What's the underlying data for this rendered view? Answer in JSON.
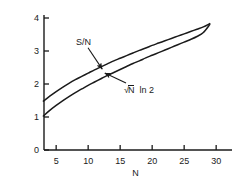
{
  "chart_data": {
    "type": "line",
    "title": "",
    "xlabel": "N",
    "ylabel": "",
    "xlim": [
      3.1,
      31.3
    ],
    "ylim": [
      0,
      4.15
    ],
    "grid": false,
    "legend_position": "inline-annotations",
    "xticks": [
      5,
      10,
      15,
      20,
      25,
      30
    ],
    "xtick_labels": [
      "5",
      "10",
      "15",
      "20",
      "25",
      "30"
    ],
    "yticks": [
      0,
      1,
      2,
      3,
      4
    ],
    "ytick_labels": [
      "0",
      "1",
      "2",
      "3",
      "4"
    ],
    "line_color": "#1a1a1a",
    "background_color": "#ffffff",
    "series": [
      {
        "name": "S/N",
        "label": "S/N",
        "x": [
          3,
          4,
          5,
          6,
          7,
          8,
          9,
          10,
          11,
          12,
          13,
          14,
          15,
          16,
          17,
          18,
          19,
          20,
          21,
          22,
          23,
          24,
          25,
          26,
          27,
          28,
          29
        ],
        "values": [
          1.48,
          1.63,
          1.77,
          1.9,
          2.02,
          2.13,
          2.23,
          2.33,
          2.43,
          2.52,
          2.61,
          2.7,
          2.78,
          2.86,
          2.94,
          3.02,
          3.09,
          3.17,
          3.24,
          3.31,
          3.38,
          3.45,
          3.52,
          3.59,
          3.66,
          3.73,
          3.83
        ]
      },
      {
        "name": "sqrtN-ln2",
        "label": "√N ln 2",
        "x": [
          3,
          4,
          5,
          6,
          7,
          8,
          9,
          10,
          11,
          12,
          13,
          14,
          15,
          16,
          17,
          18,
          19,
          20,
          21,
          22,
          23,
          24,
          25,
          26,
          27,
          28,
          29
        ],
        "values": [
          1.03,
          1.2,
          1.35,
          1.49,
          1.62,
          1.74,
          1.85,
          1.96,
          2.06,
          2.16,
          2.26,
          2.35,
          2.44,
          2.53,
          2.62,
          2.7,
          2.79,
          2.87,
          2.95,
          3.03,
          3.11,
          3.19,
          3.27,
          3.35,
          3.44,
          3.56,
          3.8
        ]
      }
    ],
    "annotations": [
      {
        "name": "sn-label",
        "text": "S/N",
        "target_x": 12.2,
        "target_y": 2.45,
        "text_x": 8.1,
        "text_y": 3.25
      },
      {
        "name": "sqrtn-ln2-label",
        "text_parts": {
          "radical": "√",
          "radicand": "N",
          "rest": "ln 2"
        },
        "text": "√N ln 2",
        "target_x": 12.6,
        "target_y": 2.33,
        "text_x": 15.6,
        "text_y": 1.82
      }
    ]
  },
  "axes": {
    "x_axis_title": "N",
    "y_axis_title": ""
  }
}
